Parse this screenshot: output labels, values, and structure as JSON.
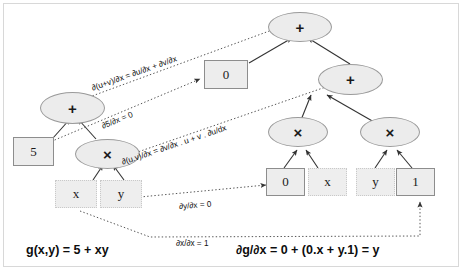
{
  "diagram": {
    "colors": {
      "node_fill": "#ececec",
      "node_stroke": "#9a9a9a",
      "dotted_stroke": "#c9c9c9",
      "arrow": "#333333",
      "frame": "#d8d8d8",
      "text": "#111111"
    },
    "left_tree": {
      "root": "+",
      "const": "5",
      "mul": "×",
      "leaf_left": "x",
      "leaf_right": "y"
    },
    "right_tree": {
      "root": "+",
      "const": "0",
      "inner_plus": "+",
      "mul_left": "×",
      "mul_right": "×",
      "mul_left_operand_a": "0",
      "mul_left_operand_b": "x",
      "mul_right_operand_a": "y",
      "mul_right_operand_b": "1"
    },
    "rules": [
      "∂(u+v)/∂x = ∂u/∂x + ∂v/∂x",
      "∂5/∂x = 0",
      "∂(u.v)/∂x = ∂v/∂x . u + v . ∂u/dx",
      "∂y/∂x = 0",
      "∂x/∂x = 1"
    ],
    "formulas": {
      "left": "g(x,y) = 5 + xy",
      "right": "∂g/∂x = 0 + (0.x + y.1) = y"
    }
  }
}
